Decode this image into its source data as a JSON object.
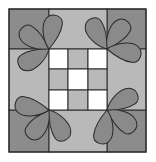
{
  "diagram": {
    "title": "",
    "colors": {
      "background": "#ffffff",
      "corner_square": "#8c8c8c",
      "side_square": "#b9b9b9",
      "center_light": "#ffffff",
      "center_dark": "#b9b9b9",
      "petal": "#8a8a8a",
      "outline": "#2a2a2a"
    },
    "center_grid": [
      [
        "white",
        "gray",
        "white"
      ],
      [
        "gray",
        "white",
        "gray"
      ],
      [
        "white",
        "gray",
        "white"
      ]
    ],
    "petal_groups": 4,
    "petals_per_group": 3
  }
}
